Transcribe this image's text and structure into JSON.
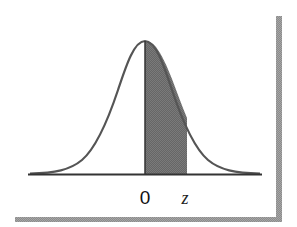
{
  "figure": {
    "title": "",
    "labels": {
      "zero": "0",
      "z": "z"
    },
    "colors": {
      "curve": "#555555",
      "shade": "#6e6e6e",
      "axis": "#333333",
      "shadow": "#8a8a8a",
      "background": "#ffffff"
    },
    "shaded_region": {
      "from": "0",
      "to": "z"
    }
  }
}
